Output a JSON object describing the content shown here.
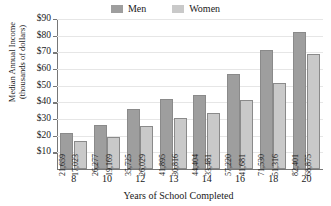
{
  "chart_data": {
    "type": "bar",
    "title": "",
    "xlabel": "Years of School Completed",
    "ylabel_line1": "Median Annual Income",
    "ylabel_line2": "(thousands of dollars)",
    "categories": [
      "8",
      "10",
      "12",
      "13",
      "14",
      "16",
      "18",
      "20"
    ],
    "series": [
      {
        "name": "Men",
        "color": "#9e9e9e",
        "values": [
          21659,
          26277,
          35725,
          41895,
          44404,
          57220,
          71530,
          82401
        ],
        "labels": [
          "21,659",
          "26,277",
          "35,725",
          "41,895",
          "44,404",
          "57,220",
          "71,530",
          "82,401"
        ]
      },
      {
        "name": "Women",
        "color": "#c9c9c9",
        "values": [
          17023,
          19169,
          26029,
          30816,
          33481,
          41681,
          51316,
          68875
        ],
        "labels": [
          "17,023",
          "19,169",
          "26,029",
          "30,816",
          "33,481",
          "41,681",
          "51,316",
          "68,875"
        ]
      }
    ],
    "ylim": [
      0,
      90000
    ],
    "ytick_values": [
      10000,
      20000,
      30000,
      40000,
      50000,
      60000,
      70000,
      80000,
      90000
    ],
    "ytick_labels": [
      "$10",
      "$20",
      "$30",
      "$40",
      "$50",
      "$60",
      "$70",
      "$80",
      "$90"
    ],
    "grid": true,
    "legend_position": "top-center"
  },
  "legend": {
    "entries": [
      {
        "label": "Men",
        "color": "#9e9e9e"
      },
      {
        "label": "Women",
        "color": "#c9c9c9"
      }
    ]
  }
}
